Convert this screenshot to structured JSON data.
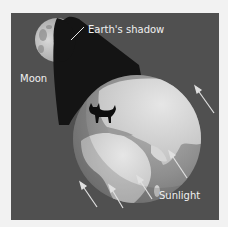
{
  "diagram": {
    "labels": {
      "earth_shadow": "Earth's shadow",
      "moon": "Moon",
      "sunlight": "Sunlight"
    },
    "elements": {
      "earth": "earth-globe",
      "moon": "moon-partially-shadowed",
      "shadow_cone": "earth-shadow-cone",
      "sunlight_arrows": 5,
      "cat_silhouette": "cat-icon"
    },
    "colors": {
      "page_background": "#f2f2f2",
      "panel_background": "#505050",
      "shadow": "#141414",
      "ocean": "#8a8a8a",
      "land": "#cfcfcf",
      "moon_lit": "#c8c8c8",
      "text": "#f0f0f0",
      "arrow": "#e0e0e0"
    }
  }
}
